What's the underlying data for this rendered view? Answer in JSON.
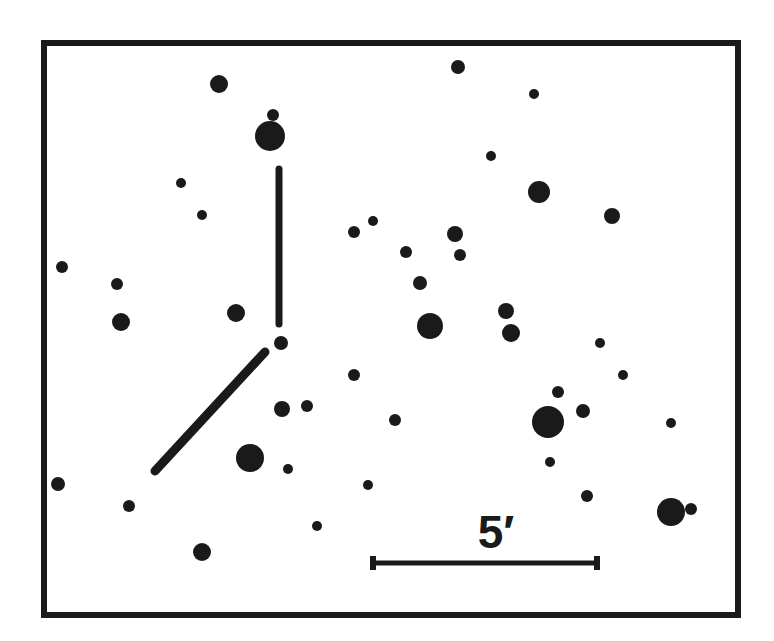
{
  "figure": {
    "type": "finder-chart",
    "colors": {
      "ink": "#1a1a1a",
      "background": "#ffffff"
    },
    "frame": {
      "x": 44,
      "y": 43,
      "width": 694,
      "height": 572,
      "stroke": 6
    },
    "scale_bar": {
      "label": "5′",
      "x1": 373,
      "x2": 597,
      "y": 563,
      "tick_half_height": 7
    },
    "pointer": {
      "vertical": {
        "x1": 279,
        "y1": 169,
        "x2": 279,
        "y2": 324
      },
      "diagonal": {
        "x1": 265,
        "y1": 352,
        "x2": 155,
        "y2": 471
      },
      "target_star": {
        "x": 281,
        "y": 343,
        "r": 7
      }
    }
  },
  "stars": [
    {
      "x": 219,
      "y": 84,
      "r": 9
    },
    {
      "x": 273,
      "y": 115,
      "r": 6
    },
    {
      "x": 270,
      "y": 136,
      "r": 15
    },
    {
      "x": 458,
      "y": 67,
      "r": 7
    },
    {
      "x": 534,
      "y": 94,
      "r": 5
    },
    {
      "x": 181,
      "y": 183,
      "r": 5
    },
    {
      "x": 202,
      "y": 215,
      "r": 5
    },
    {
      "x": 491,
      "y": 156,
      "r": 5
    },
    {
      "x": 539,
      "y": 192,
      "r": 11
    },
    {
      "x": 612,
      "y": 216,
      "r": 8
    },
    {
      "x": 62,
      "y": 267,
      "r": 6
    },
    {
      "x": 117,
      "y": 284,
      "r": 6
    },
    {
      "x": 121,
      "y": 322,
      "r": 9
    },
    {
      "x": 236,
      "y": 313,
      "r": 9
    },
    {
      "x": 354,
      "y": 232,
      "r": 6
    },
    {
      "x": 373,
      "y": 221,
      "r": 5
    },
    {
      "x": 406,
      "y": 252,
      "r": 6
    },
    {
      "x": 455,
      "y": 234,
      "r": 8
    },
    {
      "x": 460,
      "y": 255,
      "r": 6
    },
    {
      "x": 420,
      "y": 283,
      "r": 7
    },
    {
      "x": 430,
      "y": 326,
      "r": 13
    },
    {
      "x": 506,
      "y": 311,
      "r": 8
    },
    {
      "x": 511,
      "y": 333,
      "r": 9
    },
    {
      "x": 600,
      "y": 343,
      "r": 5
    },
    {
      "x": 623,
      "y": 375,
      "r": 5
    },
    {
      "x": 354,
      "y": 375,
      "r": 6
    },
    {
      "x": 282,
      "y": 409,
      "r": 8
    },
    {
      "x": 307,
      "y": 406,
      "r": 6
    },
    {
      "x": 395,
      "y": 420,
      "r": 6
    },
    {
      "x": 558,
      "y": 392,
      "r": 6
    },
    {
      "x": 548,
      "y": 422,
      "r": 16
    },
    {
      "x": 583,
      "y": 411,
      "r": 7
    },
    {
      "x": 671,
      "y": 423,
      "r": 5
    },
    {
      "x": 250,
      "y": 458,
      "r": 14
    },
    {
      "x": 288,
      "y": 469,
      "r": 5
    },
    {
      "x": 550,
      "y": 462,
      "r": 5
    },
    {
      "x": 58,
      "y": 484,
      "r": 7
    },
    {
      "x": 129,
      "y": 506,
      "r": 6
    },
    {
      "x": 368,
      "y": 485,
      "r": 5
    },
    {
      "x": 587,
      "y": 496,
      "r": 6
    },
    {
      "x": 671,
      "y": 512,
      "r": 14
    },
    {
      "x": 691,
      "y": 509,
      "r": 6
    },
    {
      "x": 317,
      "y": 526,
      "r": 5
    },
    {
      "x": 202,
      "y": 552,
      "r": 9
    }
  ]
}
